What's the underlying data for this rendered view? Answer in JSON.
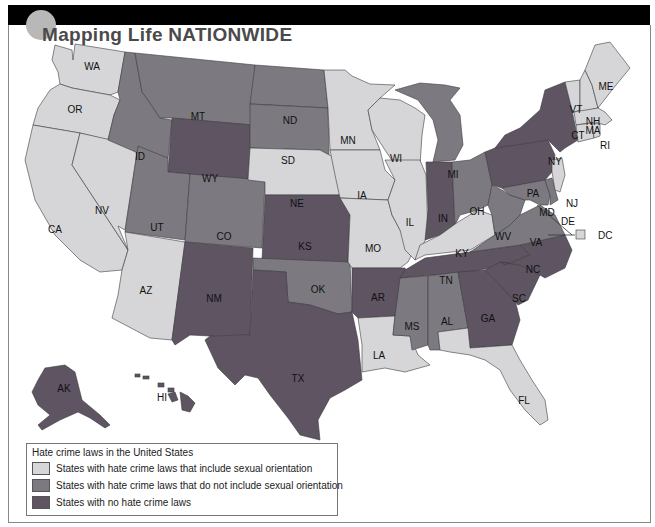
{
  "header": {
    "title": "Mapping Life NATIONWIDE"
  },
  "colors": {
    "include_sexual_orientation": "#d6d6d8",
    "not_include_sexual_orientation": "#7c7a80",
    "no_hate_crime_laws": "#5e5462",
    "border": "#3d3d40",
    "top_bar": "#000000"
  },
  "legend": {
    "title": "Hate crime laws in the United States",
    "items": [
      {
        "label": "States with hate crime laws that include sexual orientation",
        "category": "include_sexual_orientation",
        "color": "#d6d6d8"
      },
      {
        "label": "States with hate crime laws that do not include sexual orientation",
        "category": "not_include_sexual_orientation",
        "color": "#7c7a80"
      },
      {
        "label": "States with no hate crime laws",
        "category": "no_hate_crime_laws",
        "color": "#5e5462"
      }
    ]
  },
  "map": {
    "states": {
      "WA": {
        "label": "WA",
        "category": "include_sexual_orientation"
      },
      "OR": {
        "label": "OR",
        "category": "include_sexual_orientation"
      },
      "CA": {
        "label": "CA",
        "category": "include_sexual_orientation"
      },
      "NV": {
        "label": "NV",
        "category": "include_sexual_orientation"
      },
      "ID": {
        "label": "ID",
        "category": "not_include_sexual_orientation"
      },
      "MT": {
        "label": "MT",
        "category": "not_include_sexual_orientation"
      },
      "WY": {
        "label": "WY",
        "category": "no_hate_crime_laws"
      },
      "UT": {
        "label": "UT",
        "category": "not_include_sexual_orientation"
      },
      "CO": {
        "label": "CO",
        "category": "not_include_sexual_orientation"
      },
      "AZ": {
        "label": "AZ",
        "category": "include_sexual_orientation"
      },
      "NM": {
        "label": "NM",
        "category": "no_hate_crime_laws"
      },
      "ND": {
        "label": "ND",
        "category": "not_include_sexual_orientation"
      },
      "SD": {
        "label": "SD",
        "category": "not_include_sexual_orientation"
      },
      "NE": {
        "label": "NE",
        "category": "include_sexual_orientation"
      },
      "KS": {
        "label": "KS",
        "category": "no_hate_crime_laws"
      },
      "OK": {
        "label": "OK",
        "category": "not_include_sexual_orientation"
      },
      "TX": {
        "label": "TX",
        "category": "no_hate_crime_laws"
      },
      "MN": {
        "label": "MN",
        "category": "include_sexual_orientation"
      },
      "IA": {
        "label": "IA",
        "category": "include_sexual_orientation"
      },
      "MO": {
        "label": "MO",
        "category": "include_sexual_orientation"
      },
      "AR": {
        "label": "AR",
        "category": "no_hate_crime_laws"
      },
      "LA": {
        "label": "LA",
        "category": "include_sexual_orientation"
      },
      "WI": {
        "label": "WI",
        "category": "include_sexual_orientation"
      },
      "IL": {
        "label": "IL",
        "category": "include_sexual_orientation"
      },
      "MI": {
        "label": "MI",
        "category": "not_include_sexual_orientation"
      },
      "IN": {
        "label": "IN",
        "category": "no_hate_crime_laws"
      },
      "OH": {
        "label": "OH",
        "category": "not_include_sexual_orientation"
      },
      "KY": {
        "label": "KY",
        "category": "include_sexual_orientation"
      },
      "TN": {
        "label": "TN",
        "category": "no_hate_crime_laws"
      },
      "MS": {
        "label": "MS",
        "category": "not_include_sexual_orientation"
      },
      "AL": {
        "label": "AL",
        "category": "not_include_sexual_orientation"
      },
      "GA": {
        "label": "GA",
        "category": "no_hate_crime_laws"
      },
      "FL": {
        "label": "FL",
        "category": "include_sexual_orientation"
      },
      "SC": {
        "label": "SC",
        "category": "no_hate_crime_laws"
      },
      "NC": {
        "label": "NC",
        "category": "no_hate_crime_laws"
      },
      "VA": {
        "label": "VA",
        "category": "not_include_sexual_orientation"
      },
      "WV": {
        "label": "WV",
        "category": "not_include_sexual_orientation"
      },
      "PA": {
        "label": "PA",
        "category": "no_hate_crime_laws"
      },
      "NY": {
        "label": "NY",
        "category": "no_hate_crime_laws"
      },
      "MD": {
        "label": "MD",
        "category": "not_include_sexual_orientation"
      },
      "DE": {
        "label": "DE",
        "category": "not_include_sexual_orientation"
      },
      "NJ": {
        "label": "NJ",
        "category": "include_sexual_orientation"
      },
      "CT": {
        "label": "CT",
        "category": "include_sexual_orientation"
      },
      "RI": {
        "label": "RI",
        "category": "include_sexual_orientation"
      },
      "MA": {
        "label": "MA",
        "category": "include_sexual_orientation"
      },
      "VT": {
        "label": "VT",
        "category": "include_sexual_orientation"
      },
      "NH": {
        "label": "NH",
        "category": "include_sexual_orientation"
      },
      "ME": {
        "label": "ME",
        "category": "include_sexual_orientation"
      },
      "DC": {
        "label": "DC",
        "category": "include_sexual_orientation"
      },
      "AK": {
        "label": "AK",
        "category": "no_hate_crime_laws"
      },
      "HI": {
        "label": "HI",
        "category": "no_hate_crime_laws"
      }
    }
  }
}
